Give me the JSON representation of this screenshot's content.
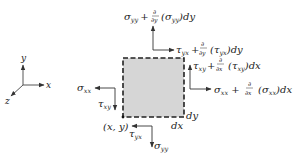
{
  "diagram": {
    "axes": {
      "x": "x",
      "y": "y",
      "z": "z"
    },
    "element": {
      "fill": "#d6d6d6",
      "border": "#222222",
      "border_style": "dashed"
    },
    "labels": {
      "top": {
        "sym": "σ",
        "sub": "yy",
        "plus": "+",
        "num": "∂",
        "den": "∂y",
        "arg": "(σ",
        "argsub": "yy",
        "tail": ")dy"
      },
      "top_shear": {
        "sym": "τ",
        "sub": "yx",
        "plus": "+",
        "num": "∂",
        "den": "∂y",
        "arg": "(τ",
        "argsub": "yx",
        "tail": ")dy"
      },
      "right_shear": {
        "sym": "τ",
        "sub": "xy",
        "plus": "+",
        "num": "∂",
        "den": "∂x",
        "arg": "(τ",
        "argsub": "xy",
        "tail": ")dx"
      },
      "right": {
        "sym": "σ",
        "sub": "xx",
        "plus": "+",
        "num": "∂",
        "den": "∂x",
        "arg": "(σ",
        "argsub": "xx",
        "tail": ")dx"
      },
      "left": {
        "sym": "σ",
        "sub": "xx"
      },
      "left_shear": {
        "sym": "τ",
        "sub": "xy"
      },
      "bottom_shear": {
        "sym": "τ",
        "sub": "yx"
      },
      "bottom": {
        "sym": "σ",
        "sub": "yy"
      },
      "origin": "(x, y)",
      "dx": "dx",
      "dy": "dy"
    }
  }
}
